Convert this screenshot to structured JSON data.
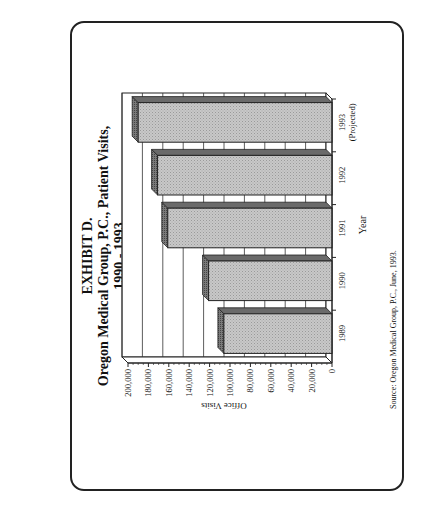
{
  "title": {
    "line1": "EXHIBIT D.",
    "line2": "Oregon Medical Group, P.C., Patient Visits,",
    "line3": "1990 - 1993"
  },
  "source": "Source: Oregon Medical Group, P.C., June, 1993.",
  "chart_data": {
    "type": "bar",
    "orientation": "rotated 90° counter-clockwise on page (vertical 3D bar chart)",
    "title": "EXHIBIT D. Oregon Medical Group, P.C., Patient Visits, 1990 - 1993",
    "xlabel": "Year",
    "ylabel": "Office Visits",
    "categories": [
      "1989",
      "1990",
      "1991",
      "1992",
      "1993 (Projected)"
    ],
    "category_labels": [
      [
        "1989"
      ],
      [
        "1990"
      ],
      [
        "1991"
      ],
      [
        "1992"
      ],
      [
        "1993",
        "(Projected)"
      ]
    ],
    "values": [
      106000,
      121000,
      161000,
      171000,
      190000
    ],
    "ylim": [
      0,
      200000
    ],
    "yticks": [
      0,
      20000,
      40000,
      60000,
      80000,
      100000,
      120000,
      140000,
      160000,
      180000,
      200000
    ],
    "ytick_labels": [
      "0",
      "20,000",
      "40,000",
      "60,000",
      "80,000",
      "100,000",
      "120,000",
      "140,000",
      "160,000",
      "180,000",
      "200,000"
    ],
    "grid": true,
    "legend": null,
    "bar_fill": "#c8c8c8",
    "bar_side_fill": "#7a7a7a",
    "bar_top_fill": "#8e8e8e",
    "source": "Source: Oregon Medical Group, P.C., June, 1993."
  }
}
